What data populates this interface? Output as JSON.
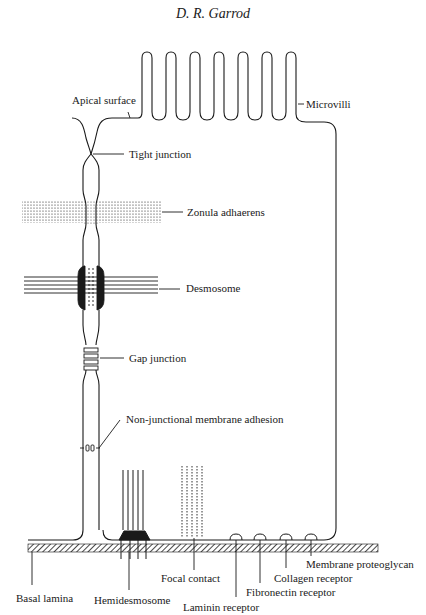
{
  "header": {
    "author": "D. R. Garrod"
  },
  "labels": {
    "apical_surface": "Apical surface",
    "microvilli": "Microvilli",
    "tight_junction": "Tight junction",
    "zonula_adhaerens": "Zonula adhaerens",
    "desmosome": "Desmosome",
    "gap_junction": "Gap junction",
    "non_junctional": "Non-junctional membrane adhesion",
    "basal_lamina": "Basal lamina",
    "hemidesmosome": "Hemidesmosome",
    "focal_contact": "Focal contact",
    "laminin_receptor": "Laminin receptor",
    "fibronectin_receptor": "Fibronectin receptor",
    "collagen_receptor": "Collagen receptor",
    "membrane_proteoglycan": "Membrane proteoglycan"
  },
  "colors": {
    "line": "#1a1a1a",
    "background": "#ffffff"
  }
}
